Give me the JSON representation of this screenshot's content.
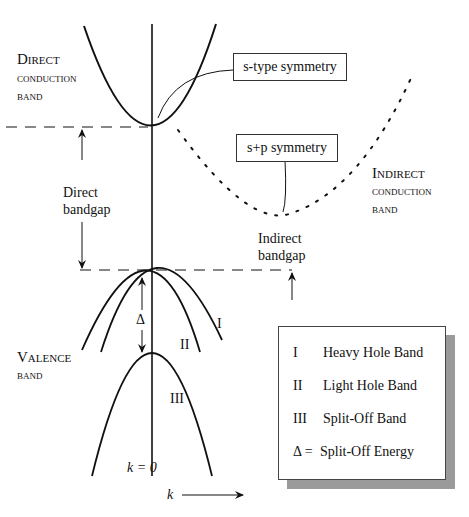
{
  "labels": {
    "direct_conduction_band": [
      "Direct",
      "conduction",
      "band"
    ],
    "indirect_conduction_band": [
      "Indirect",
      "conduction",
      "band"
    ],
    "valence_band": [
      "Valence",
      "band"
    ],
    "direct_bandgap": [
      "Direct",
      "bandgap"
    ],
    "indirect_bandgap": [
      "Indirect",
      "bandgap"
    ],
    "s_type_symmetry": "s-type symmetry",
    "sp_symmetry": "s+p symmetry",
    "delta": "Δ",
    "band_I": "I",
    "band_II": "II",
    "band_III": "III",
    "k_zero": "k = 0",
    "k_axis": "k"
  },
  "legend": {
    "items": [
      {
        "symbol": "I",
        "label": "Heavy Hole Band"
      },
      {
        "symbol": "II",
        "label": "Light Hole Band"
      },
      {
        "symbol": "III",
        "label": "Split-Off Band"
      },
      {
        "symbol": "Δ =",
        "label": "Split-Off Energy"
      }
    ]
  },
  "colors": {
    "line": "#111111",
    "shadow": "#9a9a9a"
  }
}
